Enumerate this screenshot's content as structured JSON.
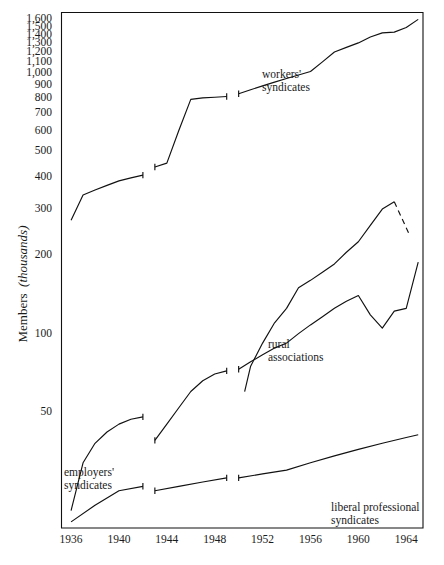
{
  "chart_data": {
    "type": "line",
    "title": "",
    "xlabel": "",
    "ylabel": "Members",
    "ylabel_unit": "(thousands)",
    "yscale": "log",
    "ylim": [
      18,
      1700
    ],
    "xlim": [
      1935.2,
      1965.4
    ],
    "grid": false,
    "legend": "inline-annotations",
    "ytick_labels": [
      "1,600",
      "1,500",
      "1,400",
      "1,300",
      "1,200",
      "1,100",
      "1,000",
      "900",
      "800",
      "700",
      "600",
      "500",
      "400",
      "300",
      "200",
      "100",
      "50"
    ],
    "ytick_values": [
      1600,
      1500,
      1400,
      1300,
      1200,
      1100,
      1000,
      900,
      800,
      700,
      600,
      500,
      400,
      300,
      200,
      100,
      50
    ],
    "xtick_labels": [
      "1936",
      "1940",
      "1944",
      "1948",
      "1952",
      "1956",
      "1960",
      "1964"
    ],
    "xtick_values": [
      1936,
      1940,
      1944,
      1948,
      1952,
      1956,
      1960,
      1964
    ],
    "series": [
      {
        "name": "workers' syndicates",
        "label": "workers'\nsyndicates",
        "segments": [
          {
            "x": [
              1936,
              1937,
              1938,
              1939,
              1940,
              1941,
              1942
            ],
            "y": [
              272,
              340,
              355,
              370,
              385,
              395,
              405
            ]
          },
          {
            "x": [
              1943,
              1944,
              1945,
              1946,
              1947,
              1948,
              1949
            ],
            "y": [
              435,
              450,
              600,
              790,
              800,
              805,
              810
            ]
          },
          {
            "x": [
              1950,
              1951,
              1952,
              1953,
              1954,
              1955,
              1956,
              1957,
              1958,
              1959,
              1960,
              1961,
              1962,
              1963,
              1964,
              1965
            ],
            "y": [
              830,
              860,
              890,
              920,
              950,
              980,
              1010,
              1100,
              1200,
              1250,
              1300,
              1370,
              1420,
              1430,
              1490,
              1600
            ]
          }
        ]
      },
      {
        "name": "rural associations",
        "label": "rural\nassociations",
        "segments": [
          {
            "x": [
              1950.5,
              1951,
              1952,
              1953,
              1954,
              1955,
              1956,
              1957,
              1958,
              1959,
              1960,
              1961,
              1962,
              1963
            ],
            "y": [
              60,
              75,
              92,
              110,
              125,
              150,
              160,
              172,
              185,
              205,
              225,
              260,
              300,
              320
            ]
          }
        ],
        "dashed_segment": {
          "x": [
            1963,
            1964.2
          ],
          "y": [
            320,
            243
          ]
        }
      },
      {
        "name": "employers' syndicates",
        "label": "employers'\nsyndicates",
        "segments": [
          {
            "x": [
              1936,
              1937,
              1938,
              1939,
              1940,
              1941,
              1942
            ],
            "y": [
              21,
              32,
              38,
              42,
              45,
              47,
              48
            ]
          },
          {
            "x": [
              1943,
              1944,
              1945,
              1946,
              1947,
              1948,
              1949
            ],
            "y": [
              39,
              45,
              52,
              60,
              66,
              70,
              72
            ]
          },
          {
            "x": [
              1950,
              1951,
              1952,
              1953,
              1954,
              1955,
              1956,
              1957,
              1958,
              1959,
              1960,
              1961,
              1962,
              1963,
              1964,
              1965
            ],
            "y": [
              73,
              78,
              83,
              88,
              92,
              100,
              108,
              116,
              125,
              133,
              140,
              118,
              105,
              122,
              125,
              188
            ]
          }
        ]
      },
      {
        "name": "liberal professional syndicates",
        "label": "liberal professional\nsyndicates",
        "segments": [
          {
            "x": [
              1936,
              1938,
              1940,
              1942
            ],
            "y": [
              19,
              22,
              25,
              26
            ]
          },
          {
            "x": [
              1943,
              1945,
              1947,
              1949
            ],
            "y": [
              25,
              26,
              27,
              28
            ]
          },
          {
            "x": [
              1950,
              1952,
              1954,
              1956,
              1958,
              1960,
              1962,
              1964,
              1965
            ],
            "y": [
              28,
              29,
              30,
              32,
              34,
              36,
              38,
              40,
              41
            ]
          }
        ]
      }
    ]
  },
  "axis": {
    "y_label_main": "Members",
    "y_label_unit": "(thousands)"
  },
  "annotations": {
    "workers_line1": "workers'",
    "workers_line2": "syndicates",
    "rural_line1": "rural",
    "rural_line2": "associations",
    "employers_line1": "employers'",
    "employers_line2": "syndicates",
    "liberal_line1": "liberal professional",
    "liberal_line2": "syndicates"
  },
  "colors": {
    "ink": "#111111",
    "background": "#ffffff"
  }
}
